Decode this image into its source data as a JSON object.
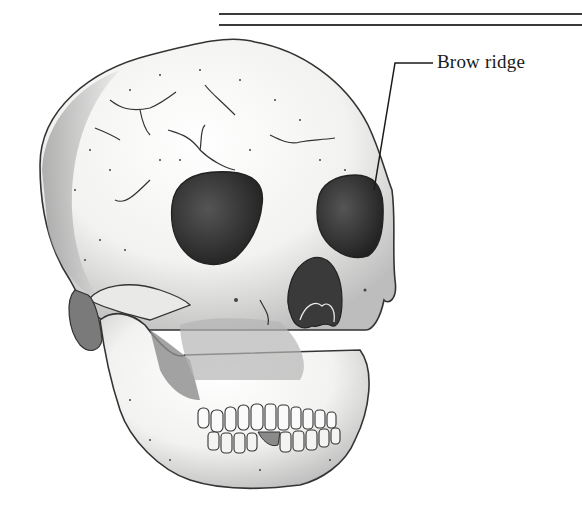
{
  "figure": {
    "labels": [
      {
        "id": "brow-ridge",
        "text": "Brow ridge"
      }
    ]
  },
  "colors": {
    "ink": "#1a1a1a",
    "rule": "#3a3a3a",
    "bone": "#f4f4f2",
    "shade": "#8a8a8a",
    "cavity": "#2b2b2b"
  }
}
